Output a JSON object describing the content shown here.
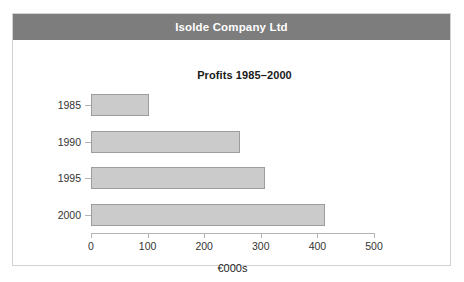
{
  "header": {
    "title": "Isolde Company Ltd"
  },
  "chart_data": {
    "type": "bar",
    "orientation": "horizontal",
    "title": "Profits 1985–2000",
    "xlabel": "€000s",
    "ylabel": "",
    "categories": [
      "1985",
      "1990",
      "1995",
      "2000"
    ],
    "values": [
      102,
      263,
      307,
      414
    ],
    "xlim": [
      0,
      500
    ],
    "xticks": [
      0,
      100,
      200,
      300,
      400,
      500
    ],
    "xticklabels": [
      "0",
      "100",
      "200",
      "300",
      "400",
      "500"
    ],
    "grid": false,
    "legend": false,
    "bar_fill_color": "#cbcbcb",
    "bar_edge_color": "#9d9d9d",
    "axis_color": "#b4b4b4",
    "header_background_color": "#7d7d7d",
    "header_text_color": "#ffffff",
    "card_border_color": "#d2d2d2",
    "page_background_color": "#ffffff"
  }
}
